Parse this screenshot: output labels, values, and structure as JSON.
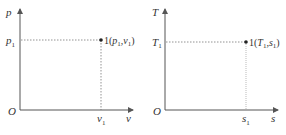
{
  "diagrams": [
    {
      "id": "pv",
      "y_axis_label": "p",
      "x_axis_label": "v",
      "origin_label": "O",
      "y_tick": {
        "base": "p",
        "sub": "1"
      },
      "x_tick": {
        "base": "v",
        "sub": "1"
      },
      "point": {
        "prefix": "1(",
        "a": "p",
        "a_sub": "1",
        "sep": ",",
        "b": "v",
        "b_sub": "1",
        "suffix": ")"
      }
    },
    {
      "id": "Ts",
      "y_axis_label": "T",
      "x_axis_label": "s",
      "origin_label": "O",
      "y_tick": {
        "base": "T",
        "sub": "1"
      },
      "x_tick": {
        "base": "s",
        "sub": "1"
      },
      "point": {
        "prefix": "1(",
        "a": "T",
        "a_sub": "1",
        "sep": ",",
        "b": "s",
        "b_sub": "1",
        "suffix": ")"
      }
    }
  ],
  "colors": {
    "axis": "#555555",
    "dashed": "#777777",
    "point": "#222222",
    "text": "#333333"
  }
}
